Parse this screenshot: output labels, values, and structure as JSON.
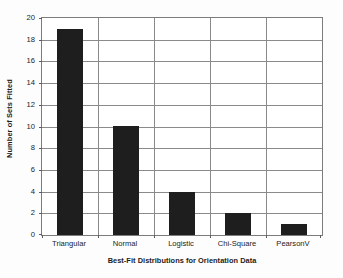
{
  "chart_data": {
    "type": "bar",
    "title": "",
    "subtitle": "",
    "categories": [
      "Triangular",
      "Normal",
      "Logistic",
      "Chi-Square",
      "PearsonV"
    ],
    "values": [
      19,
      10,
      4,
      2,
      1
    ],
    "series": [
      {
        "name": "Number of Sets Fitted",
        "values": [
          19,
          10,
          4,
          2,
          1
        ]
      }
    ],
    "xlabel": "Best-Fit Distributions for Orientation Data",
    "ylabel": "Number of Sets Fitted",
    "ylim": [
      0,
      20
    ],
    "ytick_labels": [
      "0",
      "2",
      "4",
      "6",
      "8",
      "10",
      "12",
      "14",
      "16",
      "18",
      "20"
    ],
    "ytick_values": [
      0,
      2,
      4,
      6,
      8,
      10,
      12,
      14,
      16,
      18,
      20
    ],
    "ytick_step": 2,
    "grid": "horizontal-and-vertical-category-separators",
    "legend": "none",
    "bar_color": "#1e1e1e",
    "grid_color": "#8a8a8a",
    "axis_color": "#7c7c7c",
    "background_color": "#ffffff",
    "text_color": "#1c1c1c"
  }
}
